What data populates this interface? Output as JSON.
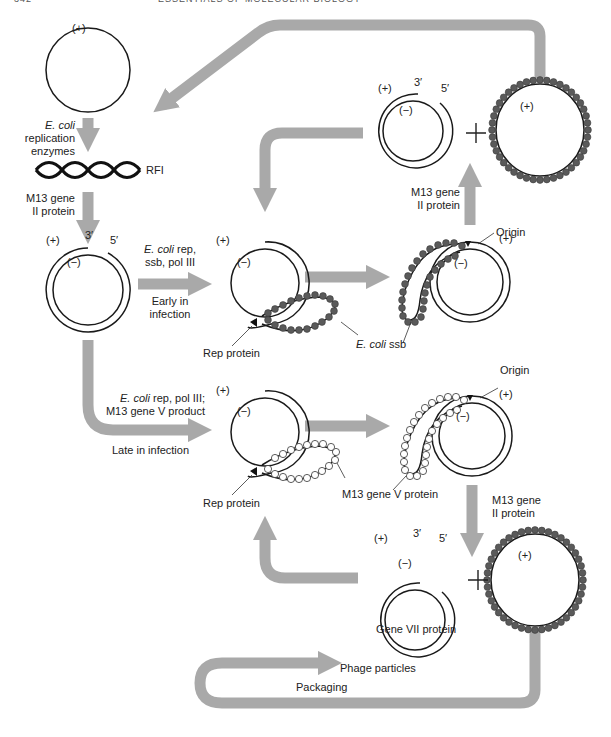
{
  "header": {
    "page_number": "342",
    "running_title": "ESSENTIALS OF MOLECULAR BIOLOGY"
  },
  "diagram": {
    "colors": {
      "arrow": "#a9a9a9",
      "strand": "#1a1a1a",
      "ssb_bead": "#5a5a5a",
      "gene_v_bead": "#ffffff"
    },
    "strand_labels": {
      "plus": "(+)",
      "minus": "(−)",
      "three_prime": "3′",
      "five_prime": "5′"
    },
    "nodes": {
      "ss_genome": {
        "strand": "(+)"
      },
      "rfi": {
        "label": "RFI"
      },
      "nicked_rf": {
        "plus": "(+)",
        "minus": "(−)",
        "end3": "3′",
        "end5": "5′"
      },
      "early_rolling_circle": {
        "plus": "(+)",
        "minus": "(−)"
      },
      "early_ssb_intermediate": {
        "plus": "(+)",
        "minus": "(−)"
      },
      "early_product_rf": {
        "plus": "(+)",
        "minus": "(−)",
        "end3": "3′",
        "end5": "5′"
      },
      "early_product_ss": {
        "strand": "(+)"
      },
      "late_rolling_circle": {
        "plus": "(+)",
        "minus": "(−)"
      },
      "late_gene_v_intermediate": {
        "plus": "(+)",
        "minus": "(−)"
      },
      "late_product_rf": {
        "plus": "(+)",
        "minus": "(−)",
        "end3": "3′",
        "end5": "5′"
      },
      "late_product_ss": {
        "strand": "(+)"
      }
    },
    "labels": {
      "ecoli_replication": {
        "italic": "E. coli",
        "line2": "replication",
        "line3": "enzymes"
      },
      "m13_gene_ii_left": {
        "line1": "M13 gene",
        "line2": "II protein"
      },
      "early_enzymes": {
        "italic": "E. coli",
        "rest": " rep,",
        "line2": "ssb, pol III"
      },
      "early_in_infection": {
        "line1": "Early in",
        "line2": "infection"
      },
      "rep_protein_early": "Rep protein",
      "ecoli_ssb": {
        "italic": "E. coli",
        "rest": " ssb"
      },
      "origin_early": "Origin",
      "m13_gene_ii_top": {
        "line1": "M13 gene",
        "line2": "II protein"
      },
      "late_enzymes": {
        "italic": "E. coli",
        "rest": " rep, pol III;",
        "line2": "M13 gene V product"
      },
      "late_in_infection": "Late in infection",
      "rep_protein_late": "Rep protein",
      "m13_gene_v_protein": "M13 gene V protein",
      "origin_late": "Origin",
      "m13_gene_ii_right": {
        "line1": "M13 gene",
        "line2": "II protein"
      },
      "gene_vii_protein": "Gene VII protein",
      "phage_particles": "Phage particles",
      "packaging": "Packaging",
      "plus_sign": "+"
    }
  }
}
